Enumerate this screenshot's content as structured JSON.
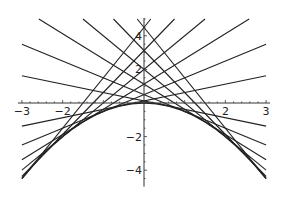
{
  "chart_data": {
    "type": "line",
    "title": "",
    "xlabel": "",
    "ylabel": "",
    "xlim": [
      -3,
      3
    ],
    "ylim": [
      -4.5,
      5
    ],
    "grid": false,
    "legend": null,
    "x_ticks": [
      -3,
      -2,
      -1,
      1,
      2,
      3
    ],
    "x_tick_labels": [
      "-3",
      "-2",
      "",
      "",
      "2",
      "3"
    ],
    "y_ticks": [
      -4,
      -2,
      2,
      4
    ],
    "y_tick_labels": [
      "-4",
      "-2",
      "2",
      "4"
    ],
    "curve": {
      "name": "parabola",
      "formula": "y = -x^2/2",
      "x": [
        -3,
        -2.5,
        -2,
        -1.5,
        -1,
        -0.5,
        0,
        0.5,
        1,
        1.5,
        2,
        2.5,
        3
      ],
      "y": [
        -4.5,
        -3.125,
        -2,
        -1.125,
        -0.5,
        -0.125,
        0,
        -0.125,
        -0.5,
        -1.125,
        -2,
        -3.125,
        -4.5
      ]
    },
    "series": [
      {
        "name": "tangent a=-3",
        "slope": 3,
        "intercept": 4.5
      },
      {
        "name": "tangent a=-2.5",
        "slope": 2.5,
        "intercept": 3.125
      },
      {
        "name": "tangent a=-2",
        "slope": 2,
        "intercept": 2
      },
      {
        "name": "tangent a=-1.5",
        "slope": 1.5,
        "intercept": 1.125
      },
      {
        "name": "tangent a=-1",
        "slope": 1,
        "intercept": 0.5
      },
      {
        "name": "tangent a=-0.5",
        "slope": 0.5,
        "intercept": 0.125
      },
      {
        "name": "tangent a=0.5",
        "slope": -0.5,
        "intercept": 0.125
      },
      {
        "name": "tangent a=1",
        "slope": -1,
        "intercept": 0.5
      },
      {
        "name": "tangent a=1.5",
        "slope": -1.5,
        "intercept": 1.125
      },
      {
        "name": "tangent a=2",
        "slope": -2,
        "intercept": 2
      },
      {
        "name": "tangent a=2.5",
        "slope": -2.5,
        "intercept": 3.125
      },
      {
        "name": "tangent a=3",
        "slope": -3,
        "intercept": 4.5
      }
    ]
  },
  "style": {
    "line_color": "#222222",
    "axis_color": "#333333",
    "background": "#ffffff"
  }
}
